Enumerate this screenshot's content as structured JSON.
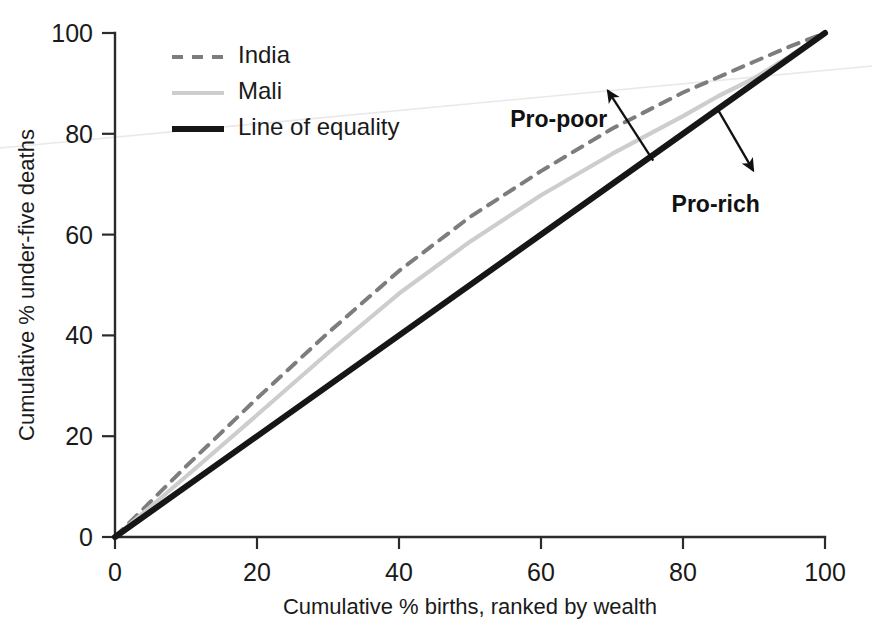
{
  "chart_data": {
    "type": "line",
    "title": "",
    "xlabel": "Cumulative % births, ranked by wealth",
    "ylabel": "Cumulative % under-five deaths",
    "xlim": [
      0,
      100
    ],
    "ylim": [
      0,
      100
    ],
    "xticks": [
      0,
      20,
      40,
      60,
      80,
      100
    ],
    "yticks": [
      0,
      20,
      40,
      60,
      80,
      100
    ],
    "xticklabels": [
      "0",
      "20",
      "40",
      "60",
      "80",
      "100"
    ],
    "yticklabels": [
      "0",
      "20",
      "40",
      "60",
      "80",
      "100"
    ],
    "grid": false,
    "legend_position": "upper left",
    "series": [
      {
        "name": "India",
        "style": "dashed",
        "color": "#7d7d7d",
        "width": 4.0,
        "x": [
          0,
          5,
          10,
          20,
          30,
          40,
          50,
          60,
          70,
          80,
          90,
          95,
          100
        ],
        "y": [
          0,
          7.0,
          14.0,
          27.5,
          40.5,
          52.8,
          63.5,
          72.6,
          81.0,
          88.2,
          94.3,
          97.3,
          100
        ]
      },
      {
        "name": "Mali",
        "style": "solid",
        "color": "#cdcdcd",
        "width": 4.2,
        "x": [
          0,
          5,
          10,
          20,
          30,
          40,
          50,
          60,
          70,
          80,
          85,
          90,
          95,
          100
        ],
        "y": [
          0,
          6.0,
          12.0,
          24.2,
          36.5,
          48.3,
          58.6,
          67.8,
          76.0,
          83.5,
          87.5,
          91.0,
          95.4,
          100
        ]
      },
      {
        "name": "Line of equality",
        "style": "solid",
        "color": "#161616",
        "width": 6.0,
        "x": [
          0,
          100
        ],
        "y": [
          0,
          100
        ]
      }
    ],
    "annotations": [
      {
        "label": "Pro-poor",
        "label_x": 62.5,
        "label_y": 83.0,
        "arrow_from_x": 75.8,
        "arrow_from_y": 74.7,
        "arrow_to_x": 69.4,
        "arrow_to_y": 88.6
      },
      {
        "label": "Pro-rich",
        "label_x": 84.6,
        "label_y": 66.0,
        "arrow_from_x": 85.0,
        "arrow_from_y": 84.6,
        "arrow_to_x": 89.9,
        "arrow_to_y": 72.7
      }
    ]
  },
  "legend": {
    "items": [
      {
        "label": "India"
      },
      {
        "label": "Mali"
      },
      {
        "label": "Line of equality"
      }
    ]
  }
}
